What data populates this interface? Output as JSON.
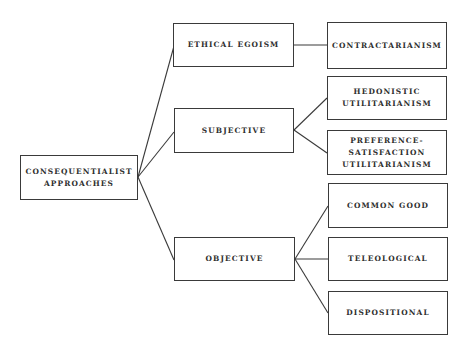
{
  "diagram": {
    "type": "tree",
    "colors": {
      "background": "#ffffff",
      "stroke": "#3a3a3a",
      "text": "#2e2e2e"
    },
    "root": {
      "id": "root",
      "label": "CONSEQUENTIALIST\nAPPROACHES"
    },
    "nodes": {
      "ethical_egoism": {
        "label": "ETHICAL EGOISM"
      },
      "subjective": {
        "label": "SUBJECTIVE"
      },
      "objective": {
        "label": "OBJECTIVE"
      },
      "contractarianism": {
        "label": "CONTRACTARIANISM"
      },
      "hedonistic": {
        "label": "HEDONISTIC\nUTILITARIANISM"
      },
      "preference": {
        "label": "PREFERENCE-\nSATISFACTION\nUTILITARIANISM"
      },
      "common_good": {
        "label": "COMMON GOOD"
      },
      "teleological": {
        "label": "TELEOLOGICAL"
      },
      "dispositional": {
        "label": "DISPOSITIONAL"
      }
    },
    "edges": [
      [
        "root",
        "ethical_egoism"
      ],
      [
        "root",
        "subjective"
      ],
      [
        "root",
        "objective"
      ],
      [
        "ethical_egoism",
        "contractarianism"
      ],
      [
        "subjective",
        "hedonistic"
      ],
      [
        "subjective",
        "preference"
      ],
      [
        "objective",
        "common_good"
      ],
      [
        "objective",
        "teleological"
      ],
      [
        "objective",
        "dispositional"
      ]
    ]
  }
}
